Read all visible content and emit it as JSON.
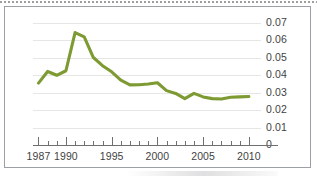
{
  "figure": {
    "border_color": "#9aa0a6",
    "background": "#ffffff"
  },
  "chart_data": {
    "type": "line",
    "title": "",
    "subtitle": "",
    "xlabel": "",
    "ylabel": "",
    "grid": true,
    "legend": null,
    "line_color": "#7d9a33",
    "xlim": [
      1986.4,
      2011.0
    ],
    "ylim": [
      0,
      0.07
    ],
    "ytick_labels": [
      "0.07",
      "0.06",
      "0.05",
      "0.04",
      "0.03",
      "0.02",
      "0.01",
      "0"
    ],
    "ytick_values": [
      0.07,
      0.06,
      0.05,
      0.04,
      0.03,
      0.02,
      0.01,
      0
    ],
    "xtick_labels": [
      "1987",
      "1990",
      "1995",
      "2000",
      "2005",
      "2010"
    ],
    "xtick_values": [
      1987,
      1990,
      1995,
      2000,
      2005,
      2010
    ],
    "x_minor_ticks_every": 1,
    "x": [
      1987,
      1988,
      1989,
      1990,
      1991,
      1992,
      1993,
      1994,
      1995,
      1996,
      1997,
      1998,
      1999,
      2000,
      2001,
      2002,
      2003,
      2004,
      2005,
      2006,
      2007,
      2008,
      2009,
      2010
    ],
    "values": [
      0.0355,
      0.0422,
      0.04,
      0.0426,
      0.0645,
      0.062,
      0.0502,
      0.0455,
      0.042,
      0.0372,
      0.0345,
      0.0346,
      0.035,
      0.0357,
      0.0312,
      0.0296,
      0.0266,
      0.0296,
      0.0276,
      0.0266,
      0.0264,
      0.0274,
      0.0276,
      0.0278
    ],
    "peak": {
      "x": 1991,
      "y": 0.0645
    },
    "min": {
      "x": 2007,
      "y": 0.0264
    }
  }
}
